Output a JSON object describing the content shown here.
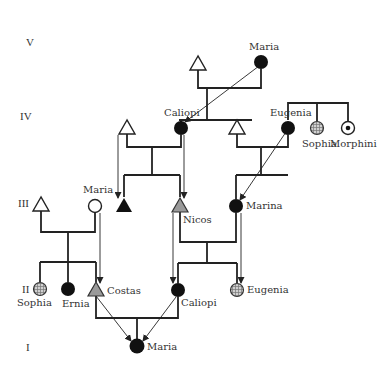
{
  "diagram": {
    "type": "pedigree",
    "colors": {
      "line": "#222222",
      "affected": "#111111",
      "carrier_gray": "#9a9a9a",
      "hatched": "#b8b8b8",
      "background": "#ffffff"
    },
    "generations": [
      {
        "id": "V",
        "label": "V"
      },
      {
        "id": "IV",
        "label": "IV"
      },
      {
        "id": "III",
        "label": "III"
      },
      {
        "id": "II",
        "label": "II"
      },
      {
        "id": "I",
        "label": "I"
      }
    ],
    "individuals": {
      "v_male": {
        "name": "",
        "sex": "male",
        "status": "unaffected"
      },
      "v_maria": {
        "name": "Maria",
        "sex": "female",
        "status": "affected"
      },
      "iv_male1": {
        "name": "",
        "sex": "male",
        "status": "unaffected"
      },
      "iv_caliopi": {
        "name": "Caliopi",
        "sex": "female",
        "status": "affected"
      },
      "iv_male2": {
        "name": "",
        "sex": "male",
        "status": "unaffected"
      },
      "iv_eugenia": {
        "name": "Eugenia",
        "sex": "female",
        "status": "affected"
      },
      "iv_sophia": {
        "name": "Sophia",
        "sex": "female",
        "status": "hatched"
      },
      "iv_morphini": {
        "name": "Morphini",
        "sex": "female",
        "status": "carrier-dot"
      },
      "iii_male1": {
        "name": "",
        "sex": "male",
        "status": "unaffected"
      },
      "iii_maria": {
        "name": "Maria",
        "sex": "female",
        "status": "unaffected"
      },
      "iii_male_affected": {
        "name": "",
        "sex": "male",
        "status": "affected"
      },
      "iii_nicos": {
        "name": "Nicos",
        "sex": "male",
        "status": "gray"
      },
      "iii_marina": {
        "name": "Marina",
        "sex": "female",
        "status": "affected"
      },
      "ii_sophia": {
        "name": "Sophia",
        "sex": "female",
        "status": "hatched"
      },
      "ii_ernia": {
        "name": "Ernia",
        "sex": "female",
        "status": "affected"
      },
      "ii_costas": {
        "name": "Costas",
        "sex": "male",
        "status": "gray"
      },
      "ii_caliopi": {
        "name": "Caliopi",
        "sex": "female",
        "status": "affected"
      },
      "ii_eugenia": {
        "name": "Eugenia",
        "sex": "female",
        "status": "hatched"
      },
      "i_maria": {
        "name": "Maria",
        "sex": "female",
        "status": "affected"
      }
    },
    "transmission_arrows": [
      {
        "from": "V Maria",
        "to": "IV Caliopi"
      },
      {
        "from": "IV male (left)",
        "to": "III affected male"
      },
      {
        "from": "IV Caliopi",
        "to": "III Nicos"
      },
      {
        "from": "IV Eugenia",
        "to": "III Marina"
      },
      {
        "from": "III Maria",
        "to": "II Costas"
      },
      {
        "from": "III Nicos",
        "to": "II Caliopi"
      },
      {
        "from": "III Marina",
        "to": "II Eugenia"
      },
      {
        "from": "II Costas",
        "to": "I Maria"
      },
      {
        "from": "II Caliopi",
        "to": "I Maria"
      }
    ]
  }
}
